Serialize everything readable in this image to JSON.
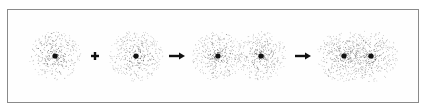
{
  "diagram": {
    "stages": [
      {
        "label": "atom-1",
        "nuclei_x": [
          55
        ],
        "cloud_r": 26
      },
      {
        "label": "atom-2",
        "nuclei_x": [
          136
        ],
        "cloud_r": 27
      },
      {
        "label": "approaching-atoms",
        "nuclei_x": [
          218,
          261
        ],
        "cloud_r": 26
      },
      {
        "label": "bonded-molecule",
        "nuclei_x": [
          344,
          371
        ],
        "cloud_r": 27
      }
    ],
    "operators": [
      {
        "type": "plus",
        "x": 95
      },
      {
        "type": "arrow",
        "x": 177
      },
      {
        "type": "arrow",
        "x": 303
      }
    ],
    "center_y": 56,
    "colors": {
      "frame": "#8a8a8a",
      "dots": "#333333",
      "nucleus": "#111111"
    }
  }
}
